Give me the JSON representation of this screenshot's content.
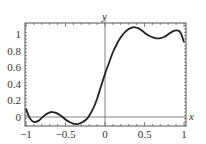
{
  "chart_data": {
    "type": "line",
    "title": "",
    "xlabel": "x",
    "ylabel": "y",
    "xlim": [
      -1,
      1
    ],
    "ylim": [
      -0.1,
      1.12
    ],
    "grid": false,
    "legend": null,
    "x_ticks": [
      -1,
      -0.5,
      0,
      0.5,
      1
    ],
    "x_tick_labels": [
      "-1",
      "-0.5",
      "0",
      "0.5",
      "1"
    ],
    "y_ticks": [
      0,
      0.2,
      0.4,
      0.6,
      0.8,
      1
    ],
    "y_tick_labels": [
      "0",
      "0.2",
      "0.4",
      "0.6",
      "0.8",
      "1"
    ],
    "series": [
      {
        "name": "curve",
        "color": "#222222",
        "x": [
          -1.0,
          -0.97,
          -0.94,
          -0.9,
          -0.85,
          -0.8,
          -0.75,
          -0.7,
          -0.67,
          -0.62,
          -0.55,
          -0.5,
          -0.45,
          -0.4,
          -0.35,
          -0.3,
          -0.25,
          -0.21,
          -0.15,
          -0.1,
          -0.05,
          0.0,
          0.05,
          0.1,
          0.15,
          0.2,
          0.25,
          0.3,
          0.35,
          0.38,
          0.42,
          0.47,
          0.52,
          0.58,
          0.64,
          0.7,
          0.76,
          0.82,
          0.88,
          0.93,
          0.96,
          0.98,
          1.0
        ],
        "y": [
          0.1,
          0.02,
          -0.03,
          -0.06,
          -0.05,
          -0.01,
          0.03,
          0.055,
          0.06,
          0.05,
          0.01,
          -0.03,
          -0.06,
          -0.08,
          -0.085,
          -0.07,
          -0.04,
          0.0,
          0.1,
          0.22,
          0.37,
          0.52,
          0.65,
          0.78,
          0.88,
          0.96,
          1.02,
          1.06,
          1.08,
          1.08,
          1.07,
          1.04,
          1.0,
          0.97,
          0.95,
          0.95,
          0.97,
          1.01,
          1.04,
          1.04,
          1.01,
          0.96,
          0.9
        ]
      }
    ],
    "axes_lines": {
      "x0_line": true,
      "y0_line": true
    }
  }
}
